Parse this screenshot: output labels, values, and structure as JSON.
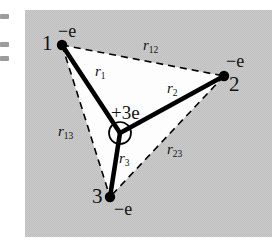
{
  "figure": {
    "name": "three-electron-system-diagram",
    "panel": {
      "background_color": "#c9c9c9",
      "texture": "halftone-gray",
      "x": 25,
      "y": 10,
      "width": 247,
      "height": 227
    },
    "interior_color": "#ffffff",
    "line_color": "#000000"
  },
  "nucleus": {
    "label": "+3e",
    "label_x": 111,
    "label_y": 103,
    "center_x": 120,
    "center_y": 133,
    "radius": 11
  },
  "vertices": [
    {
      "id": "1",
      "number_label": "1",
      "charge_label": "−e",
      "x": 62,
      "y": 45,
      "number_x": 42,
      "number_y": 33,
      "charge_x": 58,
      "charge_y": 22
    },
    {
      "id": "2",
      "number_label": "2",
      "charge_label": "−e",
      "x": 224,
      "y": 76,
      "number_x": 229,
      "number_y": 74,
      "charge_x": 226,
      "charge_y": 52
    },
    {
      "id": "3",
      "number_label": "3",
      "charge_label": "−e",
      "x": 110,
      "y": 197,
      "number_x": 92,
      "number_y": 186,
      "charge_x": 114,
      "charge_y": 200
    }
  ],
  "radii": [
    {
      "id": "r1",
      "symbol": "r",
      "subscript": "1",
      "type": "solid",
      "from": "nucleus",
      "to": "1",
      "label_x": 95,
      "label_y": 64
    },
    {
      "id": "r2",
      "symbol": "r",
      "subscript": "2",
      "type": "solid",
      "from": "nucleus",
      "to": "2",
      "label_x": 167,
      "label_y": 81
    },
    {
      "id": "r3",
      "symbol": "r",
      "subscript": "3",
      "type": "solid",
      "from": "nucleus",
      "to": "3",
      "label_x": 119,
      "label_y": 151
    },
    {
      "id": "r12",
      "symbol": "r",
      "subscript": "12",
      "type": "dashed",
      "from": "1",
      "to": "2",
      "label_x": 143,
      "label_y": 38
    },
    {
      "id": "r13",
      "symbol": "r",
      "subscript": "13",
      "type": "dashed",
      "from": "1",
      "to": "3",
      "label_x": 58,
      "label_y": 124
    },
    {
      "id": "r23",
      "symbol": "r",
      "subscript": "23",
      "type": "dashed",
      "from": "2",
      "to": "3",
      "label_x": 167,
      "label_y": 142
    }
  ],
  "edge_marks": [
    {
      "y": 14
    },
    {
      "y": 42
    },
    {
      "y": 56
    }
  ]
}
